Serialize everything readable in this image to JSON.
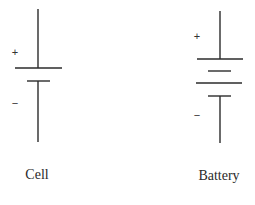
{
  "diagram": {
    "stroke_color": "#2b2b2b",
    "cell": {
      "label": "Cell",
      "plus_sign": "+",
      "minus_sign": "−"
    },
    "battery": {
      "label": "Battery",
      "plus_sign": "+",
      "minus_sign": "−"
    }
  }
}
